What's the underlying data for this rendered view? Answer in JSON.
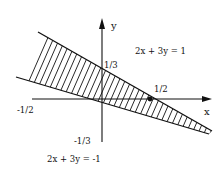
{
  "diagram": {
    "axes": {
      "x_label": "x",
      "y_label": "y"
    },
    "lines": [
      {
        "equation": "2x + 3y = 1",
        "x_intercept": "1/2",
        "y_intercept": "1/3"
      },
      {
        "equation": "2x + 3y = -1",
        "x_intercept": "-1/2",
        "y_intercept": "-1/3"
      }
    ],
    "highlighted_point": {
      "label": "1/2",
      "coords": [
        0.5,
        0
      ]
    },
    "shaded_region": "band between the lines 2x + 3y = -1 and 2x + 3y = 1 (hatched)",
    "colors": {
      "ink": "#111111",
      "background": "#ffffff"
    }
  }
}
